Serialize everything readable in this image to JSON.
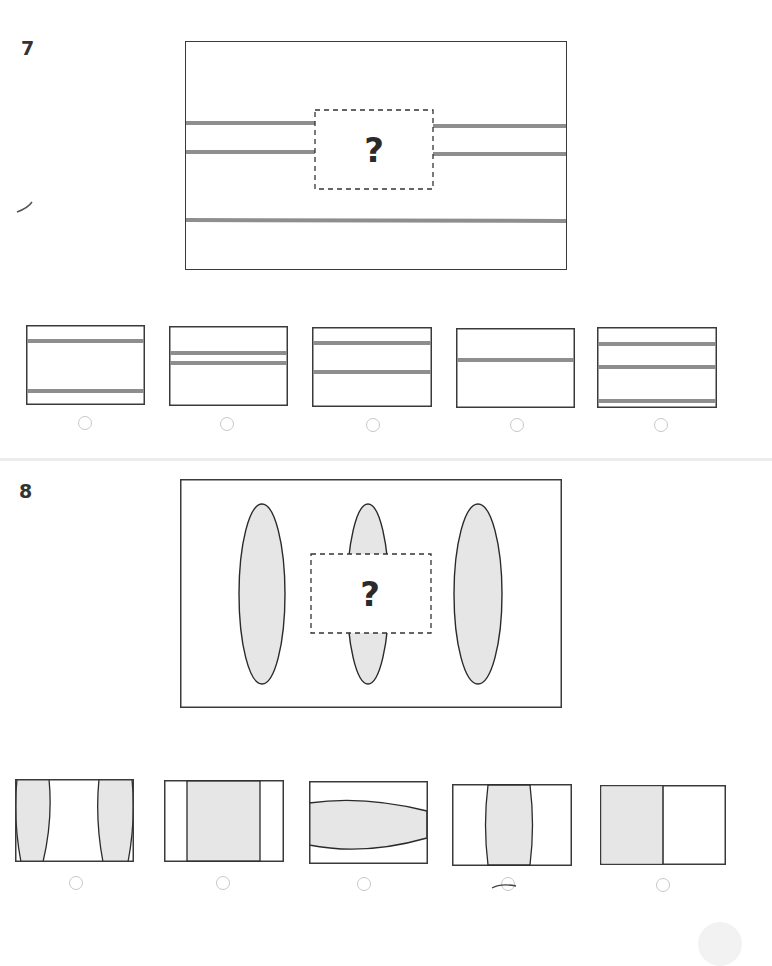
{
  "questions": [
    {
      "number": "7",
      "prompt_symbol": "?",
      "colors": {
        "line": "#8e8e8e",
        "border": "#3a3a3a"
      },
      "main_figure": {
        "description": "Rectangle with three gray horizontal lines; two upper lines interrupted by a dashed missing-piece box",
        "lines_y_left": [
          123,
          152
        ],
        "lines_y_right": [
          126,
          154
        ],
        "line_full_y": 220
      },
      "options": [
        {
          "index": 1,
          "description": "Two lines: near top and near bottom",
          "lines": [
            0.2,
            0.82
          ],
          "selected": false
        },
        {
          "index": 2,
          "description": "Two closely spaced lines in middle",
          "lines": [
            0.34,
            0.46
          ],
          "selected": false
        },
        {
          "index": 3,
          "description": "Two lines in upper half",
          "lines": [
            0.2,
            0.56
          ],
          "selected": false
        },
        {
          "index": 4,
          "description": "One line in upper middle",
          "lines": [
            0.4
          ],
          "selected": false
        },
        {
          "index": 5,
          "description": "Three lines, last near bottom",
          "lines": [
            0.2,
            0.49,
            0.93
          ],
          "selected": false
        }
      ]
    },
    {
      "number": "8",
      "prompt_symbol": "?",
      "colors": {
        "fill": "#e6e6e6",
        "border": "#3a3a3a"
      },
      "main_figure": {
        "description": "Rectangle with three vertical gray ellipses; center ellipse partially hidden by a dashed missing-piece box"
      },
      "options": [
        {
          "index": 1,
          "description": "Two curved gray slivers at left and right edges",
          "selected": false
        },
        {
          "index": 2,
          "description": "Wide gray vertical band with straight edges",
          "selected": false
        },
        {
          "index": 3,
          "description": "Horizontal gray ellipse segment",
          "selected": false
        },
        {
          "index": 4,
          "description": "Gray vertical band with slightly curved edges in center",
          "selected": false,
          "annotation": "hand-drawn pen mark across radio"
        },
        {
          "index": 5,
          "description": "Left half gray, right half white",
          "selected": false
        }
      ]
    }
  ]
}
